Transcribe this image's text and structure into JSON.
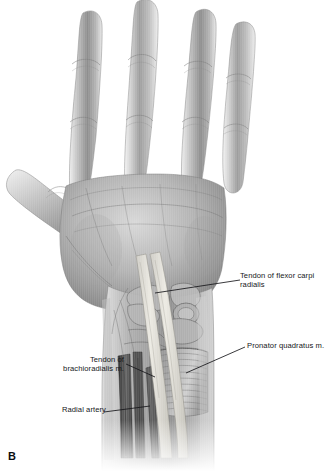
{
  "figure": {
    "panel_letter": "B",
    "background_color": "#ffffff",
    "ink_color": "#16171a",
    "skin_tone_light": "#e9e9e9",
    "skin_tone_mid": "#a9a9a9",
    "skin_tone_dark": "#5e5e5e",
    "tendon_color": "#dedcd6",
    "muscle_color": "#8f8f8f"
  },
  "labels": [
    {
      "id": "flexor-carpi-radialis",
      "text": "Tendon of flexor carpi radialis",
      "side": "right",
      "leader_from": [
        240,
        280
      ],
      "leader_to": [
        155,
        293
      ]
    },
    {
      "id": "pronator-quadratus",
      "text": "Pronator quadratus m.",
      "side": "right",
      "leader_from": [
        245,
        347
      ],
      "leader_to": [
        186,
        373
      ]
    },
    {
      "id": "brachioradialis",
      "text": "Tendon of\nbrachioradialis m.",
      "side": "left",
      "leader_from": [
        126,
        364
      ],
      "leader_to": [
        155,
        377
      ]
    },
    {
      "id": "radial-artery",
      "text": "Radial artery",
      "side": "left",
      "leader_from": [
        104,
        412
      ],
      "leader_to": [
        150,
        406
      ]
    }
  ],
  "anatomy_parts": [
    "thumb",
    "index-finger",
    "middle-finger",
    "ring-finger",
    "little-finger",
    "palm",
    "thenar-eminence",
    "hypothenar-eminence",
    "carpal-bones",
    "flexor-carpi-radialis-tendon",
    "palmaris-longus-tendon",
    "pronator-quadratus-muscle",
    "brachioradialis-tendon",
    "radial-artery",
    "distal-forearm"
  ]
}
